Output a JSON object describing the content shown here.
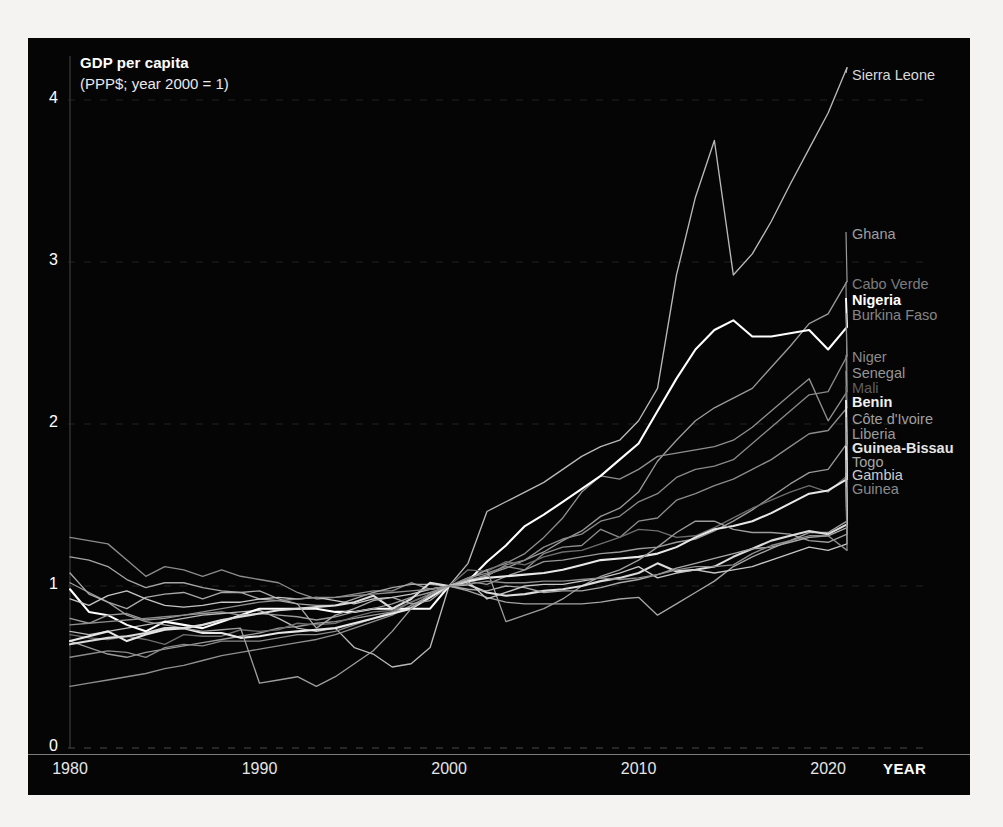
{
  "chart_data": {
    "type": "line",
    "title": "GDP per capita",
    "subtitle": "(PPP$; year 2000 = 1)",
    "xlabel": "YEAR",
    "ylabel": "",
    "xlim": [
      1980,
      2022
    ],
    "ylim": [
      0,
      4.35
    ],
    "grid": true,
    "legend_position": "right-inline",
    "xticks": [
      "1980",
      "1990",
      "2000",
      "2010",
      "2020"
    ],
    "xtick_values": [
      1980,
      1990,
      2000,
      2010,
      2020
    ],
    "yticks": [
      "0",
      "1",
      "2",
      "3",
      "4"
    ],
    "ytick_values": [
      0,
      1,
      2,
      3,
      4
    ],
    "x": [
      1980,
      1981,
      1982,
      1983,
      1984,
      1985,
      1986,
      1987,
      1988,
      1989,
      1990,
      1991,
      1992,
      1993,
      1994,
      1995,
      1996,
      1997,
      1998,
      1999,
      2000,
      2001,
      2002,
      2003,
      2004,
      2005,
      2006,
      2007,
      2008,
      2009,
      2010,
      2011,
      2012,
      2013,
      2014,
      2015,
      2016,
      2017,
      2018,
      2019,
      2020,
      2021
    ],
    "series": [
      {
        "name": "Sierra Leone",
        "color": "#b9b9b9",
        "label_color": "#d8d8d8",
        "label_y": 68,
        "bold": false,
        "values": [
          0.72,
          0.7,
          0.72,
          0.74,
          0.76,
          0.78,
          0.8,
          0.82,
          0.83,
          0.84,
          0.85,
          0.8,
          0.74,
          0.72,
          0.74,
          0.62,
          0.58,
          0.5,
          0.52,
          0.62,
          1.0,
          1.14,
          1.46,
          1.52,
          1.58,
          1.64,
          1.72,
          1.8,
          1.86,
          1.9,
          2.02,
          2.22,
          2.92,
          3.4,
          3.75,
          2.92,
          3.05,
          3.25,
          3.48,
          3.7,
          3.92,
          4.2
        ]
      },
      {
        "name": "Ghana",
        "color": "#9a9a9a",
        "label_color": "#9e9e9e",
        "label_y": 227,
        "bold": false,
        "values": [
          0.66,
          0.62,
          0.58,
          0.56,
          0.59,
          0.61,
          0.63,
          0.65,
          0.67,
          0.69,
          0.71,
          0.74,
          0.75,
          0.77,
          0.78,
          0.8,
          0.82,
          0.84,
          0.87,
          0.93,
          1.0,
          1.03,
          1.07,
          1.11,
          1.16,
          1.21,
          1.28,
          1.34,
          1.43,
          1.48,
          1.58,
          1.77,
          1.9,
          2.02,
          2.1,
          2.16,
          2.22,
          2.35,
          2.48,
          2.62,
          2.68,
          2.88
        ]
      },
      {
        "name": "Cabo Verde",
        "color": "#8f8f8f",
        "label_color": "#7c7c7c",
        "label_y": 277,
        "bold": false,
        "values": [
          0.38,
          0.4,
          0.42,
          0.44,
          0.46,
          0.49,
          0.51,
          0.54,
          0.57,
          0.59,
          0.61,
          0.63,
          0.65,
          0.67,
          0.7,
          0.74,
          0.78,
          0.82,
          0.88,
          0.94,
          1.0,
          1.05,
          1.1,
          1.14,
          1.2,
          1.3,
          1.42,
          1.58,
          1.68,
          1.66,
          1.72,
          1.8,
          1.82,
          1.84,
          1.86,
          1.9,
          1.98,
          2.08,
          2.18,
          2.28,
          2.02,
          2.2
        ]
      },
      {
        "name": "Nigeria",
        "color": "#ffffff",
        "label_color": "#ffffff",
        "label_y": 293,
        "bold": true,
        "values": [
          0.98,
          0.84,
          0.82,
          0.76,
          0.72,
          0.78,
          0.76,
          0.74,
          0.78,
          0.82,
          0.86,
          0.86,
          0.86,
          0.86,
          0.84,
          0.84,
          0.86,
          0.86,
          0.86,
          0.86,
          1.0,
          1.03,
          1.15,
          1.25,
          1.37,
          1.44,
          1.52,
          1.6,
          1.68,
          1.78,
          1.88,
          2.08,
          2.28,
          2.46,
          2.58,
          2.64,
          2.54,
          2.54,
          2.56,
          2.58,
          2.46,
          2.6
        ]
      },
      {
        "name": "Burkina Faso",
        "color": "#8a8a8a",
        "label_color": "#858585",
        "label_y": 308,
        "bold": false,
        "values": [
          0.56,
          0.58,
          0.6,
          0.59,
          0.56,
          0.62,
          0.64,
          0.63,
          0.66,
          0.66,
          0.66,
          0.68,
          0.7,
          0.7,
          0.72,
          0.76,
          0.8,
          0.84,
          0.9,
          0.95,
          1.0,
          1.04,
          1.06,
          1.13,
          1.16,
          1.24,
          1.29,
          1.32,
          1.4,
          1.43,
          1.52,
          1.57,
          1.67,
          1.72,
          1.74,
          1.78,
          1.88,
          1.98,
          2.08,
          2.18,
          2.2,
          2.42
        ]
      },
      {
        "name": "Niger",
        "color": "#8c8c8c",
        "label_color": "#8a8a8a",
        "label_y": 350,
        "bold": false,
        "values": [
          1.3,
          1.28,
          1.26,
          1.16,
          1.06,
          1.12,
          1.1,
          1.06,
          1.1,
          1.06,
          1.04,
          1.02,
          0.96,
          0.92,
          0.93,
          0.95,
          0.97,
          0.97,
          1.02,
          0.98,
          1.0,
          1.05,
          1.08,
          1.12,
          1.1,
          1.2,
          1.24,
          1.25,
          1.35,
          1.3,
          1.4,
          1.42,
          1.53,
          1.57,
          1.62,
          1.66,
          1.72,
          1.78,
          1.86,
          1.94,
          1.96,
          2.1
        ]
      },
      {
        "name": "Senegal",
        "color": "#9a9a9a",
        "label_color": "#969696",
        "label_y": 366,
        "bold": false,
        "values": [
          0.8,
          0.77,
          0.82,
          0.83,
          0.79,
          0.8,
          0.82,
          0.83,
          0.84,
          0.82,
          0.83,
          0.82,
          0.81,
          0.79,
          0.81,
          0.84,
          0.86,
          0.89,
          0.93,
          0.96,
          1.0,
          1.03,
          1.01,
          1.06,
          1.1,
          1.15,
          1.16,
          1.18,
          1.2,
          1.21,
          1.23,
          1.24,
          1.27,
          1.29,
          1.34,
          1.4,
          1.47,
          1.55,
          1.63,
          1.7,
          1.72,
          1.88
        ]
      },
      {
        "name": "Mali",
        "color": "#6e6e6e",
        "label_color": "#5e5e5e",
        "label_y": 381,
        "bold": false,
        "values": [
          0.7,
          0.68,
          0.67,
          0.69,
          0.67,
          0.64,
          0.7,
          0.69,
          0.69,
          0.73,
          0.72,
          0.73,
          0.77,
          0.76,
          0.77,
          0.81,
          0.84,
          0.85,
          0.9,
          0.95,
          1.0,
          1.1,
          1.09,
          1.15,
          1.13,
          1.18,
          1.21,
          1.22,
          1.26,
          1.3,
          1.35,
          1.34,
          1.3,
          1.31,
          1.36,
          1.42,
          1.48,
          1.53,
          1.58,
          1.62,
          1.58,
          1.68
        ]
      },
      {
        "name": "Benin",
        "color": "#e8e8e8",
        "label_color": "#f0f0f0",
        "label_y": 395,
        "bold": true,
        "values": [
          0.66,
          0.69,
          0.72,
          0.66,
          0.7,
          0.73,
          0.74,
          0.71,
          0.71,
          0.68,
          0.69,
          0.71,
          0.72,
          0.73,
          0.74,
          0.77,
          0.8,
          0.83,
          0.86,
          0.93,
          1.0,
          1.03,
          1.05,
          1.06,
          1.07,
          1.08,
          1.1,
          1.13,
          1.16,
          1.17,
          1.18,
          1.2,
          1.24,
          1.3,
          1.35,
          1.37,
          1.4,
          1.45,
          1.51,
          1.57,
          1.59,
          1.66
        ]
      },
      {
        "name": "Côte d'Ivoire",
        "color": "#a5a5a5",
        "label_color": "#a0a0a0",
        "label_y": 412,
        "bold": false,
        "values": [
          1.18,
          1.16,
          1.12,
          1.04,
          0.99,
          1.02,
          1.02,
          0.99,
          0.97,
          0.96,
          0.92,
          0.91,
          0.89,
          0.88,
          0.88,
          0.92,
          0.96,
          0.99,
          1.01,
          1.01,
          1.0,
          0.97,
          0.93,
          0.9,
          0.89,
          0.89,
          0.89,
          0.89,
          0.9,
          0.92,
          0.93,
          0.82,
          0.89,
          0.96,
          1.03,
          1.12,
          1.18,
          1.23,
          1.28,
          1.33,
          1.33,
          1.4
        ]
      },
      {
        "name": "Liberia",
        "color": "#9d9d9d",
        "label_color": "#9a9a9a",
        "label_y": 427,
        "bold": false,
        "values": [
          1.02,
          0.96,
          0.9,
          0.82,
          0.78,
          0.76,
          0.74,
          0.72,
          0.73,
          0.74,
          0.4,
          0.42,
          0.44,
          0.38,
          0.44,
          0.52,
          0.6,
          0.72,
          0.86,
          0.95,
          1.0,
          1.04,
          1.1,
          0.78,
          0.82,
          0.86,
          0.92,
          1.0,
          1.06,
          1.1,
          1.16,
          1.24,
          1.33,
          1.4,
          1.4,
          1.35,
          1.33,
          1.33,
          1.32,
          1.28,
          1.27,
          1.32
        ]
      },
      {
        "name": "Guinea-Bissau",
        "color": "#dcdcdc",
        "label_color": "#e4e4e4",
        "label_y": 441,
        "bold": true,
        "values": [
          0.64,
          0.66,
          0.68,
          0.69,
          0.71,
          0.74,
          0.74,
          0.76,
          0.79,
          0.81,
          0.83,
          0.85,
          0.86,
          0.87,
          0.88,
          0.9,
          0.94,
          0.86,
          0.92,
          1.02,
          1.0,
          1.01,
          0.96,
          0.94,
          0.95,
          0.97,
          0.98,
          1.0,
          1.03,
          1.05,
          1.08,
          1.14,
          1.09,
          1.1,
          1.12,
          1.18,
          1.23,
          1.28,
          1.31,
          1.34,
          1.32,
          1.38
        ]
      },
      {
        "name": "Togo",
        "color": "#a8a8a8",
        "label_color": "#a6a6a6",
        "label_y": 455,
        "bold": false,
        "values": [
          1.08,
          0.95,
          0.9,
          0.86,
          0.93,
          0.95,
          0.96,
          0.92,
          0.96,
          0.96,
          0.97,
          0.92,
          0.89,
          0.74,
          0.82,
          0.86,
          0.91,
          0.93,
          0.89,
          0.91,
          1.0,
          0.98,
          0.97,
          1.0,
          0.99,
          0.96,
          0.97,
          0.97,
          0.99,
          1.02,
          1.04,
          1.07,
          1.11,
          1.14,
          1.17,
          1.2,
          1.23,
          1.24,
          1.27,
          1.3,
          1.31,
          1.36
        ]
      },
      {
        "name": "Gambia",
        "color": "#c6c6c6",
        "label_color": "#cccccc",
        "label_y": 468,
        "bold": false,
        "values": [
          0.92,
          0.88,
          0.94,
          0.97,
          0.92,
          0.88,
          0.87,
          0.88,
          0.9,
          0.9,
          0.92,
          0.93,
          0.92,
          0.93,
          0.91,
          0.89,
          0.92,
          0.93,
          0.95,
          0.98,
          1.0,
          1.03,
          0.92,
          0.96,
          1.0,
          1.01,
          1.01,
          1.03,
          1.05,
          1.08,
          1.12,
          1.05,
          1.08,
          1.1,
          1.08,
          1.1,
          1.12,
          1.16,
          1.2,
          1.24,
          1.22,
          1.26
        ]
      },
      {
        "name": "Guinea",
        "color": "#8e8e8e",
        "label_color": "#8a8a8a",
        "label_y": 482,
        "bold": false,
        "values": [
          0.76,
          0.77,
          0.78,
          0.79,
          0.8,
          0.81,
          0.82,
          0.84,
          0.86,
          0.88,
          0.9,
          0.91,
          0.92,
          0.93,
          0.93,
          0.94,
          0.95,
          0.96,
          0.97,
          0.98,
          1.0,
          1.01,
          1.03,
          1.02,
          1.02,
          1.03,
          1.03,
          1.04,
          1.05,
          1.04,
          1.05,
          1.07,
          1.1,
          1.12,
          1.12,
          1.13,
          1.2,
          1.25,
          1.28,
          1.31,
          1.31,
          1.22
        ]
      }
    ]
  },
  "axis": {
    "year_label": "YEAR"
  }
}
